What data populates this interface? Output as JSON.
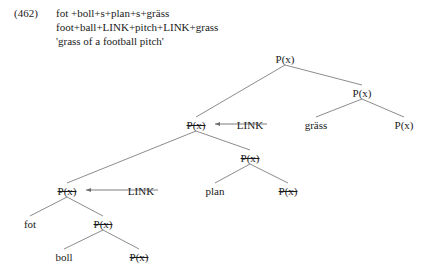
{
  "example": {
    "number": "(462)",
    "lines": [
      "fot +boll+s+plan+s+gräss",
      "foot+ball+LINK+pitch+LINK+grass",
      "'grass of a football pitch'"
    ]
  },
  "tree": {
    "label_px": "P(x)",
    "label_link": "LINK",
    "nodes": [
      {
        "id": "n0",
        "label": "P(x)",
        "x": 285,
        "y": 62,
        "struck": false
      },
      {
        "id": "n1",
        "label": "P(x)",
        "x": 362,
        "y": 96,
        "struck": false
      },
      {
        "id": "n2",
        "label": "gräss",
        "x": 316,
        "y": 128,
        "struck": false
      },
      {
        "id": "n3",
        "label": "P(x)",
        "x": 404,
        "y": 128,
        "struck": false
      },
      {
        "id": "n4",
        "label": "P(x)",
        "x": 196,
        "y": 128,
        "struck": true
      },
      {
        "id": "n5",
        "label": "LINK",
        "x": 250,
        "y": 128,
        "struck": false
      },
      {
        "id": "n6",
        "label": "P(x)",
        "x": 250,
        "y": 161,
        "struck": true
      },
      {
        "id": "n7",
        "label": "plan",
        "x": 215,
        "y": 194,
        "struck": false
      },
      {
        "id": "n8",
        "label": "P(x)",
        "x": 288,
        "y": 194,
        "struck": true
      },
      {
        "id": "n9",
        "label": "P(x)",
        "x": 67,
        "y": 194,
        "struck": true
      },
      {
        "id": "n10",
        "label": "LINK",
        "x": 141,
        "y": 194,
        "struck": false
      },
      {
        "id": "n11",
        "label": "fot",
        "x": 30,
        "y": 227,
        "struck": false
      },
      {
        "id": "n12",
        "label": "P(x)",
        "x": 103,
        "y": 227,
        "struck": true
      },
      {
        "id": "n13",
        "label": "boll",
        "x": 64,
        "y": 260,
        "struck": false
      },
      {
        "id": "n14",
        "label": "P(x)",
        "x": 139,
        "y": 260,
        "struck": true
      }
    ],
    "edges": [
      {
        "from": "n0",
        "to": "n4"
      },
      {
        "from": "n0",
        "to": "n1"
      },
      {
        "from": "n1",
        "to": "n2"
      },
      {
        "from": "n1",
        "to": "n3"
      },
      {
        "from": "n4",
        "to": "n9"
      },
      {
        "from": "n4",
        "to": "n6"
      },
      {
        "from": "n6",
        "to": "n7"
      },
      {
        "from": "n6",
        "to": "n8"
      },
      {
        "from": "n9",
        "to": "n11"
      },
      {
        "from": "n9",
        "to": "n12"
      },
      {
        "from": "n12",
        "to": "n13"
      },
      {
        "from": "n12",
        "to": "n14"
      }
    ],
    "arrows": [
      {
        "id": "a1",
        "from_x": 267,
        "to_x": 215,
        "y": 124,
        "direction": "left"
      },
      {
        "id": "a2",
        "from_x": 158,
        "to_x": 86,
        "y": 190,
        "direction": "left"
      }
    ],
    "line_color": "#6e6e6e"
  }
}
